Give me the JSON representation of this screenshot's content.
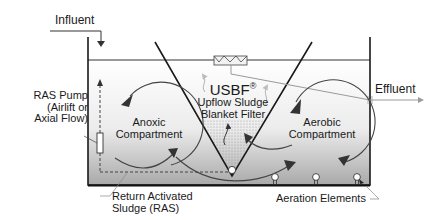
{
  "diagram": {
    "labels": {
      "influent": "Influent",
      "effluent": "Effluent",
      "ras_pump_line1": "RAS Pump",
      "ras_pump_line2": "(Airlift or",
      "ras_pump_line3": "Axial Flow)",
      "anoxic_line1": "Anoxic",
      "anoxic_line2": "Compartment",
      "aerobic_line1": "Aerobic",
      "aerobic_line2": "Compartment",
      "usbf": "USBF",
      "usbf_mark": "®",
      "usbf_sub1": "Upflow Sludge",
      "usbf_sub2": "Blanket Filter",
      "ras_line1": "Return Activated",
      "ras_line2": "Sludge (RAS)",
      "aeration": "Aeration Elements"
    },
    "colors": {
      "line": "#222222",
      "effluent_pipe": "#a0a0a0",
      "tank_fill_top": "#ffffff",
      "tank_fill_bottom": "#a8a8a8",
      "filter_dots": "#9a9a9a"
    }
  }
}
